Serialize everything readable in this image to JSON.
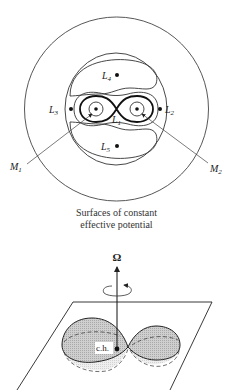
{
  "top_diagram": {
    "title": "Surfaces of constant effective potential",
    "caption_line1": "Surfaces of constant",
    "caption_line2": "effective potential",
    "lagrange_points": {
      "L1": {
        "main": "L",
        "sub": "1"
      },
      "L2": {
        "main": "L",
        "sub": "2"
      },
      "L3": {
        "main": "L",
        "sub": "3"
      },
      "L4": {
        "main": "L",
        "sub": "4"
      },
      "L5": {
        "main": "L",
        "sub": "5"
      }
    },
    "masses": {
      "M1": {
        "main": "M",
        "sub": "1"
      },
      "M2": {
        "main": "M",
        "sub": "2"
      }
    }
  },
  "bottom_diagram": {
    "rotation_axis_label": "Ω",
    "center_label": "c.h.",
    "description": "Roche lobes in orbital plane with rotation axis"
  },
  "colors": {
    "line": "#222222",
    "thin_line": "#444444",
    "lobe_fill": "#c8c8c8",
    "lobe_lower_fill": "#e6e6e6",
    "background": "#ffffff"
  }
}
